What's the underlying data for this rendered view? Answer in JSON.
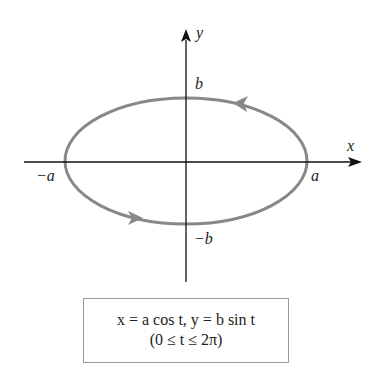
{
  "diagram": {
    "axes": {
      "x_label": "x",
      "y_label": "y"
    },
    "labels": {
      "a_pos": "a",
      "a_neg": "−a",
      "b_pos": "b",
      "b_neg": "−b"
    },
    "equation": {
      "line1": "x = a cos t, y = b sin t",
      "line2": "(0 ≤ t ≤ 2π)"
    },
    "colors": {
      "curve": "#888888",
      "axis": "#111111",
      "box_border": "#999999"
    },
    "curve": "ellipse traversed counterclockwise"
  }
}
